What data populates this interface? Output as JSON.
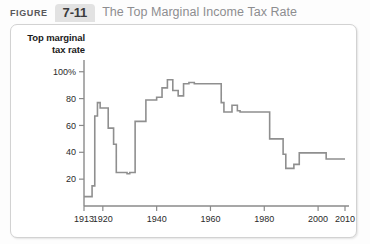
{
  "header": {
    "figure_word": "FIGURE",
    "figure_number": "7-11",
    "title": "The Top Marginal Income Tax Rate"
  },
  "colors": {
    "line": "#8f8f8f",
    "axis": "#8a8a8a",
    "tab_bg": "#e2e2e2",
    "title_text": "#8d8d90",
    "panel_bg": "#ffffff",
    "page_bg": "#fdfdfd"
  },
  "chart_data": {
    "type": "line",
    "title": "The Top Marginal Income Tax Rate",
    "xlabel": "Year",
    "ylabel": "Top marginal tax rate",
    "xlim": [
      1913,
      2010
    ],
    "ylim": [
      0,
      108
    ],
    "grid": false,
    "legend": null,
    "xticks": [
      1913,
      1920,
      1940,
      1960,
      1980,
      2000,
      2010
    ],
    "xticklabels": [
      "1913",
      "1920",
      "1940",
      "1960",
      "1980",
      "2000",
      "2010"
    ],
    "yticks": [
      20,
      40,
      60,
      80,
      100
    ],
    "yticklabels": [
      "20",
      "40",
      "60",
      "80",
      "100%"
    ],
    "series": [
      {
        "name": "Top marginal income tax rate",
        "x": [
          1913,
          1915,
          1916,
          1917,
          1918,
          1919,
          1921,
          1922,
          1924,
          1925,
          1929,
          1930,
          1932,
          1936,
          1938,
          1940,
          1941,
          1942,
          1944,
          1946,
          1948,
          1950,
          1951,
          1952,
          1954,
          1964,
          1965,
          1968,
          1970,
          1971,
          1981,
          1982,
          1987,
          1988,
          1991,
          1993,
          2003,
          2010
        ],
        "y": [
          7,
          7,
          15,
          67,
          77,
          73,
          73,
          58,
          46,
          25,
          24,
          25,
          63,
          79,
          79,
          81,
          81,
          88,
          94,
          86,
          82,
          91,
          91,
          92,
          91,
          77,
          70,
          75,
          71,
          70,
          70,
          50,
          38.5,
          28,
          31,
          39.6,
          35,
          35
        ]
      }
    ],
    "annotations": []
  }
}
